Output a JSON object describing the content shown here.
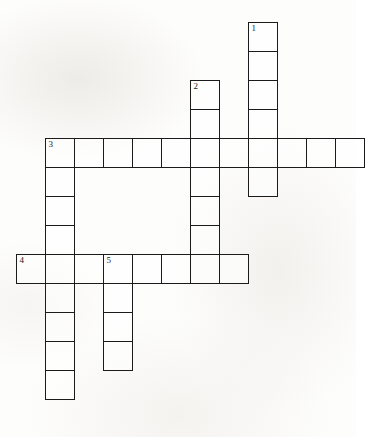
{
  "puzzle": {
    "kind": "crossword-grid",
    "title": "",
    "cell_size": 29,
    "grid_origin": {
      "x": 16,
      "y": 22
    },
    "ink_color": "#1b1b1b",
    "cell_fill": "#ffffff",
    "page_background": "#fdfdfc",
    "clue_numbers": [
      "1",
      "2",
      "3",
      "4",
      "5"
    ],
    "entries": [
      {
        "number": "1",
        "direction": "down",
        "length": 6,
        "start": {
          "col": 8,
          "row": 0
        },
        "label": "1-down"
      },
      {
        "number": "2",
        "direction": "down",
        "length": 7,
        "start": {
          "col": 6,
          "row": 2
        },
        "label": "2-down"
      },
      {
        "number": "3",
        "direction": "across",
        "length": 11,
        "start": {
          "col": 1,
          "row": 4
        },
        "label": "3-across"
      },
      {
        "number": "3",
        "direction": "down",
        "length": 9,
        "start": {
          "col": 1,
          "row": 4
        },
        "label": "3-down"
      },
      {
        "number": "4",
        "direction": "across",
        "length": 8,
        "start": {
          "col": 0,
          "row": 8
        },
        "label": "4-across"
      },
      {
        "number": "5",
        "direction": "down",
        "length": 4,
        "start": {
          "col": 3,
          "row": 8
        },
        "label": "5-down"
      }
    ],
    "cells": [
      {
        "col": 8,
        "row": 0,
        "num": "1"
      },
      {
        "col": 8,
        "row": 1,
        "num": ""
      },
      {
        "col": 8,
        "row": 2,
        "num": ""
      },
      {
        "col": 8,
        "row": 3,
        "num": ""
      },
      {
        "col": 8,
        "row": 5,
        "num": ""
      },
      {
        "col": 6,
        "row": 2,
        "num": "2"
      },
      {
        "col": 6,
        "row": 3,
        "num": ""
      },
      {
        "col": 6,
        "row": 5,
        "num": ""
      },
      {
        "col": 6,
        "row": 6,
        "num": ""
      },
      {
        "col": 6,
        "row": 7,
        "num": ""
      },
      {
        "col": 1,
        "row": 4,
        "num": "3"
      },
      {
        "col": 2,
        "row": 4,
        "num": ""
      },
      {
        "col": 3,
        "row": 4,
        "num": ""
      },
      {
        "col": 4,
        "row": 4,
        "num": ""
      },
      {
        "col": 5,
        "row": 4,
        "num": ""
      },
      {
        "col": 6,
        "row": 4,
        "num": ""
      },
      {
        "col": 7,
        "row": 4,
        "num": ""
      },
      {
        "col": 8,
        "row": 4,
        "num": ""
      },
      {
        "col": 9,
        "row": 4,
        "num": ""
      },
      {
        "col": 10,
        "row": 4,
        "num": ""
      },
      {
        "col": 11,
        "row": 4,
        "num": ""
      },
      {
        "col": 1,
        "row": 5,
        "num": ""
      },
      {
        "col": 1,
        "row": 6,
        "num": ""
      },
      {
        "col": 1,
        "row": 7,
        "num": ""
      },
      {
        "col": 0,
        "row": 8,
        "num": "4"
      },
      {
        "col": 1,
        "row": 8,
        "num": ""
      },
      {
        "col": 2,
        "row": 8,
        "num": ""
      },
      {
        "col": 3,
        "row": 8,
        "num": "5"
      },
      {
        "col": 4,
        "row": 8,
        "num": ""
      },
      {
        "col": 5,
        "row": 8,
        "num": ""
      },
      {
        "col": 6,
        "row": 8,
        "num": ""
      },
      {
        "col": 7,
        "row": 8,
        "num": ""
      },
      {
        "col": 1,
        "row": 9,
        "num": ""
      },
      {
        "col": 1,
        "row": 10,
        "num": ""
      },
      {
        "col": 1,
        "row": 11,
        "num": ""
      },
      {
        "col": 1,
        "row": 12,
        "num": ""
      },
      {
        "col": 3,
        "row": 9,
        "num": ""
      },
      {
        "col": 3,
        "row": 10,
        "num": ""
      },
      {
        "col": 3,
        "row": 11,
        "num": ""
      }
    ]
  },
  "footer": {
    "mark": ""
  }
}
